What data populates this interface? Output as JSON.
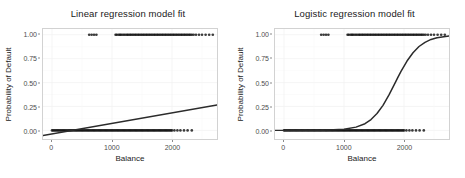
{
  "figure": {
    "width": 465,
    "height": 178,
    "background": "#ffffff"
  },
  "panels": [
    {
      "id": "linear",
      "title": "Linear regression model fit",
      "ylabel": "Probability of Default",
      "xlabel": "Balance"
    },
    {
      "id": "logistic",
      "title": "Logistic regression model fit",
      "ylabel": "Probability of Default",
      "xlabel": "Balance"
    }
  ],
  "axes": {
    "yticks": [
      "0.00",
      "0.25",
      "0.50",
      "0.75",
      "1.00"
    ],
    "ytick_values": [
      0.0,
      0.25,
      0.5,
      0.75,
      1.0
    ],
    "xticks": [
      "0",
      "1000",
      "2000"
    ],
    "xtick_values": [
      0,
      1000,
      2000
    ]
  },
  "style": {
    "line_color": "#2b2b2b",
    "point_color": "#111111",
    "panel_border": "#d2d2d2",
    "grid_major": "#f2f2f2",
    "grid_minor": "#f9f9f9",
    "tick_text": "#4d4d4d",
    "label_text": "#1a1a1a"
  },
  "chart_data": [
    {
      "type": "scatter",
      "id": "linear",
      "title": "Linear regression model fit",
      "xlabel": "Balance",
      "ylabel": "Probability of Default",
      "xlim": [
        -150,
        2750
      ],
      "ylim": [
        -0.09,
        1.06
      ],
      "grid": true,
      "legend": null,
      "series": [
        {
          "name": "Default observations (rug at y=1)",
          "type": "scatter",
          "y": 1.0,
          "x": [
            620,
            660,
            700,
            740,
            1060,
            1080,
            1110,
            1130,
            1150,
            1175,
            1200,
            1225,
            1250,
            1270,
            1295,
            1315,
            1340,
            1360,
            1385,
            1405,
            1430,
            1450,
            1475,
            1495,
            1520,
            1540,
            1565,
            1585,
            1610,
            1630,
            1655,
            1675,
            1700,
            1720,
            1745,
            1765,
            1790,
            1810,
            1835,
            1855,
            1880,
            1900,
            1925,
            1945,
            1970,
            1990,
            2015,
            2035,
            2060,
            2080,
            2105,
            2125,
            2150,
            2170,
            2195,
            2215,
            2240,
            2260,
            2285,
            2305,
            2330,
            2360,
            2400,
            2450,
            2500,
            2560,
            2620,
            2680
          ]
        },
        {
          "name": "Non-default observations (rug at y=0)",
          "type": "scatter",
          "y": 0.0,
          "x": [
            0,
            20,
            40,
            60,
            80,
            100,
            120,
            140,
            160,
            180,
            200,
            220,
            240,
            260,
            280,
            300,
            320,
            340,
            360,
            380,
            400,
            420,
            440,
            460,
            480,
            500,
            520,
            540,
            560,
            580,
            600,
            620,
            640,
            660,
            680,
            700,
            720,
            740,
            760,
            780,
            800,
            820,
            840,
            860,
            880,
            900,
            920,
            940,
            960,
            980,
            1000,
            1020,
            1040,
            1060,
            1080,
            1100,
            1120,
            1140,
            1160,
            1180,
            1200,
            1220,
            1240,
            1260,
            1280,
            1300,
            1320,
            1340,
            1360,
            1380,
            1400,
            1420,
            1440,
            1460,
            1480,
            1500,
            1520,
            1540,
            1560,
            1580,
            1600,
            1620,
            1640,
            1660,
            1680,
            1700,
            1720,
            1740,
            1760,
            1780,
            1800,
            1820,
            1840,
            1860,
            1880,
            1900,
            1920,
            1940,
            1960,
            1980,
            2000,
            2040,
            2090,
            2140,
            2200,
            2260,
            2330
          ]
        },
        {
          "name": "Linear fit",
          "type": "line",
          "x": [
            -150,
            2750
          ],
          "y": [
            -0.0543,
            0.2653
          ],
          "slope": 0.00011,
          "intercept": -0.0378
        }
      ]
    },
    {
      "type": "scatter",
      "id": "logistic",
      "title": "Logistic regression model fit",
      "xlabel": "Balance",
      "ylabel": "Probability of Default",
      "xlim": [
        -150,
        2750
      ],
      "ylim": [
        -0.09,
        1.06
      ],
      "grid": true,
      "legend": null,
      "series": [
        {
          "name": "Default observations (rug at y=1)",
          "type": "scatter",
          "y": 1.0,
          "x": [
            620,
            660,
            700,
            740,
            1060,
            1080,
            1110,
            1130,
            1150,
            1175,
            1200,
            1225,
            1250,
            1270,
            1295,
            1315,
            1340,
            1360,
            1385,
            1405,
            1430,
            1450,
            1475,
            1495,
            1520,
            1540,
            1565,
            1585,
            1610,
            1630,
            1655,
            1675,
            1700,
            1720,
            1745,
            1765,
            1790,
            1810,
            1835,
            1855,
            1880,
            1900,
            1925,
            1945,
            1970,
            1990,
            2015,
            2035,
            2060,
            2080,
            2105,
            2125,
            2150,
            2170,
            2195,
            2215,
            2240,
            2260,
            2285,
            2305,
            2330,
            2360,
            2400,
            2450,
            2500,
            2560,
            2620,
            2680
          ]
        },
        {
          "name": "Non-default observations (rug at y=0)",
          "type": "scatter",
          "y": 0.0,
          "x": [
            0,
            20,
            40,
            60,
            80,
            100,
            120,
            140,
            160,
            180,
            200,
            220,
            240,
            260,
            280,
            300,
            320,
            340,
            360,
            380,
            400,
            420,
            440,
            460,
            480,
            500,
            520,
            540,
            560,
            580,
            600,
            620,
            640,
            660,
            680,
            700,
            720,
            740,
            760,
            780,
            800,
            820,
            840,
            860,
            880,
            900,
            920,
            940,
            960,
            980,
            1000,
            1020,
            1040,
            1060,
            1080,
            1100,
            1120,
            1140,
            1160,
            1180,
            1200,
            1220,
            1240,
            1260,
            1280,
            1300,
            1320,
            1340,
            1360,
            1380,
            1400,
            1420,
            1440,
            1460,
            1480,
            1500,
            1520,
            1540,
            1560,
            1580,
            1600,
            1620,
            1640,
            1660,
            1680,
            1700,
            1720,
            1740,
            1760,
            1780,
            1800,
            1820,
            1840,
            1860,
            1880,
            1900,
            1920,
            1940,
            1960,
            1980,
            2000,
            2040,
            2090,
            2140,
            2200,
            2260,
            2330
          ]
        },
        {
          "name": "Logistic fit",
          "type": "line",
          "midpoint_x": 1900,
          "scale": 210,
          "x": [
            -150,
            250,
            650,
            1000,
            1200,
            1350,
            1450,
            1550,
            1650,
            1750,
            1850,
            1900,
            1950,
            2050,
            2150,
            2250,
            2350,
            2450,
            2550,
            2750
          ],
          "y": [
            0.0,
            0.0,
            0.001,
            0.012,
            0.034,
            0.07,
            0.113,
            0.176,
            0.262,
            0.371,
            0.494,
            0.557,
            0.617,
            0.725,
            0.812,
            0.877,
            0.921,
            0.951,
            0.969,
            0.987
          ]
        }
      ]
    }
  ]
}
